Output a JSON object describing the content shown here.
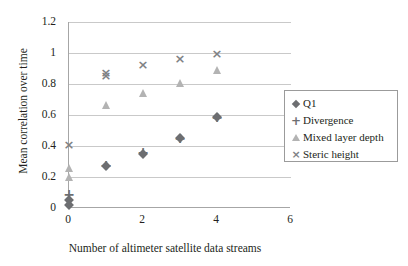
{
  "chart_data": {
    "type": "scatter",
    "title": "",
    "xlabel": "Number of altimeter satellite data streams",
    "ylabel": "Mean correlation over time",
    "xlim": [
      0,
      6
    ],
    "ylim": [
      0,
      1.2
    ],
    "xticks": [
      "0",
      "2",
      "4",
      "6"
    ],
    "xtick_values": [
      0,
      2,
      4,
      6
    ],
    "yticks": [
      "0",
      "0.2",
      "0.4",
      "0.6",
      "0.8",
      "1",
      "1.2"
    ],
    "ytick_values": [
      0,
      0.2,
      0.4,
      0.6,
      0.8,
      1,
      1.2
    ],
    "grid": "horizontal",
    "legend_position": "right",
    "x": [
      0,
      1,
      2,
      3,
      4
    ],
    "series": [
      {
        "name": "Q1",
        "marker": "diamond",
        "color": "#6d6e71",
        "values": [
          0.05,
          0.27,
          0.35,
          0.45,
          0.59
        ]
      },
      {
        "name": "Divergence",
        "marker": "plus",
        "color": "#6d6e71",
        "values": [
          0.09,
          0.28,
          0.36,
          0.45,
          0.59
        ]
      },
      {
        "name": "Mixed layer depth",
        "marker": "triangle",
        "color": "#b3b3b3",
        "values": [
          0.26,
          0.665,
          0.745,
          0.805,
          0.89
        ]
      },
      {
        "name": "Steric height",
        "marker": "cross",
        "color": "#808285",
        "values": [
          0.41,
          0.86,
          0.93,
          0.965,
          1.0
        ]
      }
    ],
    "extra_points": [
      {
        "series": "Mixed layer depth",
        "x": 0,
        "y": 0.2,
        "marker": "triangle"
      },
      {
        "series": "Q1",
        "x": 0,
        "y": 0.02,
        "marker": "diamond"
      },
      {
        "series": "Steric height",
        "x": 1,
        "y": 0.875,
        "marker": "cross"
      }
    ]
  },
  "legend": {
    "items": [
      {
        "label": "Q1",
        "marker": "diamond"
      },
      {
        "label": "Divergence",
        "marker": "plus"
      },
      {
        "label": "Mixed layer depth",
        "marker": "triangle"
      },
      {
        "label": "Steric height",
        "marker": "cross"
      }
    ]
  },
  "glyphs": {
    "plus": "+",
    "cross": "×"
  }
}
